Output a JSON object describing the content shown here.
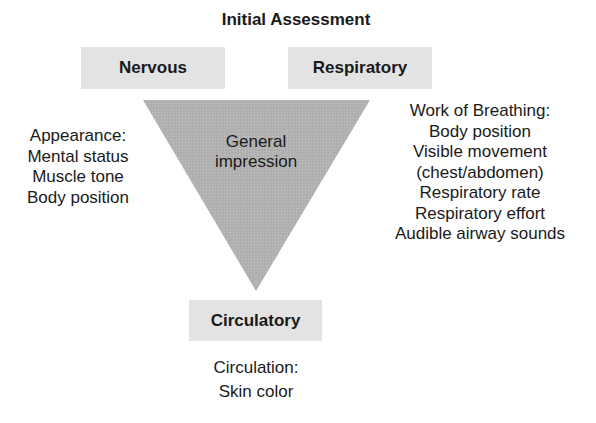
{
  "title": "Initial Assessment",
  "boxes": {
    "nervous": "Nervous",
    "respiratory": "Respiratory",
    "circulatory": "Circulatory"
  },
  "triangle": {
    "label_lines": [
      "General",
      "impression"
    ],
    "fill_color": "#b3b3b3"
  },
  "appearance": {
    "heading": "Appearance:",
    "items": [
      "Mental status",
      "Muscle tone",
      "Body position"
    ]
  },
  "work_of_breathing": {
    "heading": "Work of Breathing:",
    "items": [
      "Body position",
      "Visible movement",
      "(chest/abdomen)",
      "Respiratory rate",
      "Respiratory effort",
      "Audible airway sounds"
    ]
  },
  "circulation": {
    "heading": "Circulation:",
    "items": [
      "Skin color"
    ]
  },
  "colors": {
    "box_fill": "#e3e3e3",
    "text": "#1a1a1a"
  }
}
